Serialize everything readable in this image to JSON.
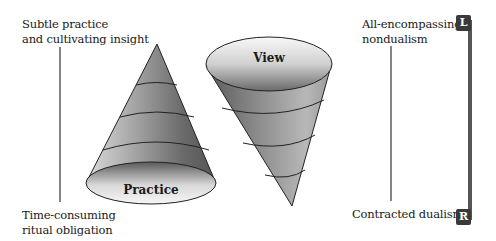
{
  "left_axis": {
    "top_label": [
      "Subtle practice",
      "and cultivating insight"
    ],
    "bottom_label": [
      "Time-consuming",
      "ritual obligation"
    ]
  },
  "right_axis": {
    "top_label": [
      "All-encompassing",
      "nondualism"
    ],
    "bottom_label": [
      "Contracted dualism"
    ]
  },
  "cones": {
    "practice": {
      "label": "Practice",
      "orientation": "apex-up",
      "bands": 3
    },
    "view": {
      "label": "View",
      "orientation": "apex-down",
      "bands": 3
    }
  },
  "scale_bar": {
    "top_tag": "L",
    "bottom_tag": "R"
  },
  "colors": {
    "line": "#333333",
    "tag": "#3a3a3a",
    "bar": "#555555",
    "shade_dark": "#4a4a4a",
    "shade_light": "#f2f2f2"
  }
}
